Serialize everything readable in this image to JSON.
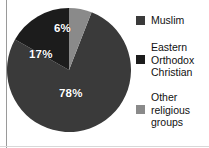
{
  "chart_data": {
    "type": "pie",
    "title": "",
    "subtitle": "",
    "xlabel": "",
    "ylabel": "",
    "legend_position": "right",
    "grid": false,
    "units": "percent",
    "start_angle_deg": 0,
    "direction": "clockwise",
    "categories": [
      "Muslim",
      "Eastern Orthodox Christian",
      "Other religious groups"
    ],
    "values": [
      78,
      17,
      6
    ],
    "data_labels": [
      "78%",
      "17%",
      "6%"
    ],
    "colors": [
      "#3a3a3a",
      "#1c1c1c",
      "#8a8a8a"
    ],
    "slices": [
      {
        "label": "Muslim",
        "value": 78,
        "data_label": "78%",
        "color": "#3a3a3a",
        "path": "M 62 62 L 62 0 A 62 62 0 1 1 31.9 53.5 Z"
      },
      {
        "label": "Eastern Orthodox Christian",
        "value": 17,
        "data_label": "17%",
        "color": "#1c1c1c",
        "path": "M 62 62 L 31.9 53.5 A 62 62 0 0 1 84.6 4.0 Z"
      },
      {
        "label": "Other religious groups",
        "value": 6,
        "data_label": "6%",
        "color": "#8a8a8a",
        "path": "M 62 62 L 84.6 4.0 A 62 62 0 0 1 62 0 Z"
      }
    ]
  },
  "pie": {
    "labels": {
      "six": "6%",
      "seventeen": "17%",
      "seventyeight": "78%"
    }
  },
  "legend": {
    "items": [
      {
        "label": "Muslim",
        "color": "#3a3a3a"
      },
      {
        "label": "Eastern\nOrthodox\nChristian",
        "color": "#1c1c1c"
      },
      {
        "label": "Other\nreligious\ngroups",
        "color": "#8a8a8a"
      }
    ]
  },
  "theme": {
    "background": "#ffffff",
    "rule_color": "#9a9a9a",
    "label_text_color": "#ffffff",
    "legend_text_color": "#111111"
  }
}
